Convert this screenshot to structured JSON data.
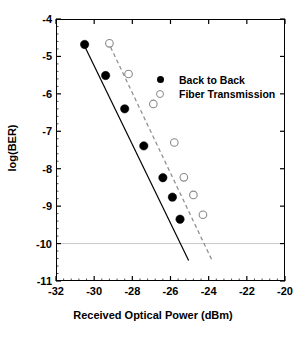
{
  "chart_data": {
    "type": "scatter",
    "title": "",
    "xlabel": "Received Optical Power (dBm)",
    "ylabel": "log(BER)",
    "xlim": [
      -32,
      -20
    ],
    "ylim": [
      -11,
      -4
    ],
    "xticks": [
      "-32",
      "-30",
      "-28",
      "-26",
      "-24",
      "-22",
      "-20"
    ],
    "xtick_values": [
      -32,
      -30,
      -28,
      -26,
      -24,
      -22,
      -20
    ],
    "yticks": [
      "-4",
      "-5",
      "-6",
      "-7",
      "-8",
      "-9",
      "-10",
      "-11"
    ],
    "ytick_values": [
      -4,
      -5,
      -6,
      -7,
      -8,
      -9,
      -10,
      -11
    ],
    "grid": false,
    "gridlines": [
      {
        "axis": "y",
        "value": -10,
        "color": "#c8c8c8",
        "style": "solid"
      }
    ],
    "legend_position": "upper right",
    "series": [
      {
        "name": "Back to Back",
        "marker": "filled-circle",
        "color": "#000000",
        "line_style": "solid",
        "points": [
          {
            "x": -30.5,
            "y": -4.68
          },
          {
            "x": -29.4,
            "y": -5.51
          },
          {
            "x": -28.4,
            "y": -6.4
          },
          {
            "x": -27.4,
            "y": -7.39
          },
          {
            "x": -26.4,
            "y": -8.24
          },
          {
            "x": -25.9,
            "y": -8.76
          },
          {
            "x": -25.5,
            "y": -9.35
          }
        ],
        "fit_line": {
          "x1": -30.6,
          "y1": -4.62,
          "x2": -25.05,
          "y2": -10.45
        }
      },
      {
        "name": "Fiber Transmission",
        "marker": "open-circle",
        "color": "#8a8a8a",
        "line_style": "dashed",
        "points": [
          {
            "x": -29.2,
            "y": -4.65
          },
          {
            "x": -28.2,
            "y": -5.47
          },
          {
            "x": -26.9,
            "y": -6.27
          },
          {
            "x": -25.8,
            "y": -7.3
          },
          {
            "x": -25.3,
            "y": -8.23
          },
          {
            "x": -24.8,
            "y": -8.7
          },
          {
            "x": -24.3,
            "y": -9.23
          }
        ],
        "fit_line": {
          "x1": -29.3,
          "y1": -4.58,
          "x2": -23.85,
          "y2": -10.42
        }
      }
    ]
  },
  "legend": {
    "items": [
      {
        "label": "Back to Back",
        "marker": "filled-circle"
      },
      {
        "label": "Fiber Transmission",
        "marker": "open-circle"
      }
    ]
  }
}
